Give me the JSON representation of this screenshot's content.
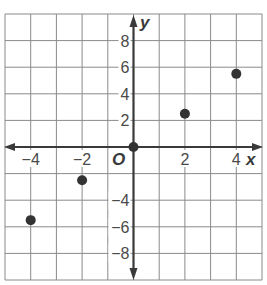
{
  "chart_data": {
    "type": "scatter",
    "title": "",
    "xlabel": "x",
    "ylabel": "y",
    "origin_label": "O",
    "xlim": [
      -5,
      5
    ],
    "ylim": [
      -10,
      10
    ],
    "grid": true,
    "x_grid_step": 1,
    "y_grid_step": 2,
    "x_tick_labels": [
      {
        "value": -4,
        "text": "−4"
      },
      {
        "value": -2,
        "text": "−2"
      },
      {
        "value": 2,
        "text": "2"
      },
      {
        "value": 4,
        "text": "4"
      }
    ],
    "y_tick_labels": [
      {
        "value": 8,
        "text": "8"
      },
      {
        "value": 6,
        "text": "6"
      },
      {
        "value": 4,
        "text": "4"
      },
      {
        "value": 2,
        "text": "2"
      },
      {
        "value": -4,
        "text": "−4"
      },
      {
        "value": -6,
        "text": "−6"
      },
      {
        "value": -8,
        "text": "−8"
      }
    ],
    "points": [
      {
        "x": -4,
        "y": -5.5
      },
      {
        "x": -2,
        "y": -2.5
      },
      {
        "x": 0,
        "y": 0
      },
      {
        "x": 2,
        "y": 2.5
      },
      {
        "x": 4,
        "y": 5.5
      }
    ],
    "colors": {
      "grid": "#8a8a8a",
      "axis": "#3a3a3a",
      "point": "#333333",
      "text": "#4a4a4a"
    }
  }
}
